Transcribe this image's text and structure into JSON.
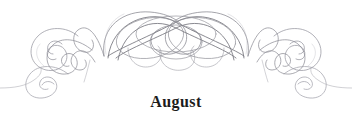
{
  "page": {
    "background_color": "#ffffff",
    "width": 352,
    "height": 128
  },
  "ornament": {
    "name": "calligraphic-flourish-divider",
    "description": "Symmetric pen-drawn calligraphic flourish with interlaced central knot and scrolled spirals at both ends",
    "stroke_color_light": "#a9a9b2",
    "stroke_color_mid": "#8a8a92",
    "stroke_color_dark": "#6a6a72"
  },
  "caption": {
    "text": "August",
    "color": "#1c1c1c"
  }
}
